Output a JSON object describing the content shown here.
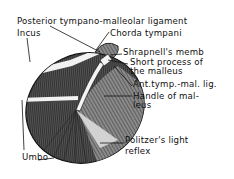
{
  "colors": {
    "ink": "#111111",
    "background": "#ffffff",
    "membrane_light": "#d8d8d8",
    "membrane_dark": "#2a2a2a"
  },
  "labels": {
    "posterior_ligament": "Posterior tympano-malleolar ligament",
    "incus": "Incus",
    "chorda_tympani": "Chorda tympani",
    "shrapnells_membrane": "Shrapnell's memb",
    "short_process_line1": "Short process of",
    "short_process_line2": "the malleus",
    "anterior_ligament": "Ant.tymp.-mal. lig.",
    "handle_line1": "Handle of mal-",
    "handle_line2": "leus",
    "light_reflex_line1": "Politzer's light",
    "light_reflex_line2": "reflex",
    "umbo": "Umbo"
  }
}
